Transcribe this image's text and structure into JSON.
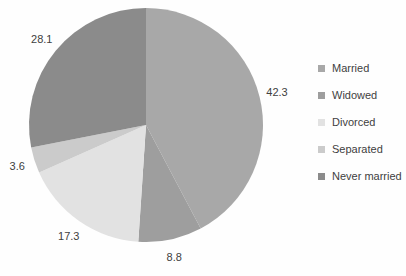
{
  "chart_data": {
    "type": "pie",
    "categories": [
      "Married",
      "Widowed",
      "Divorced",
      "Separated",
      "Never married"
    ],
    "values": [
      42.3,
      8.8,
      17.3,
      3.6,
      28.1
    ],
    "labels": [
      "42.3",
      "8.8",
      "17.3",
      "3.6",
      "28.1"
    ],
    "colors": [
      "#a8a8a8",
      "#9e9e9e",
      "#e2e2e2",
      "#cbcbcb",
      "#8b8b8b"
    ],
    "title": "",
    "legend_position": "right",
    "start_angle_deg": 0,
    "direction": "clockwise",
    "label_color": "#404040",
    "background": "#fefefe",
    "geometry": {
      "center_x": 146,
      "center_y": 125,
      "radius": 117,
      "label_radius": 135
    }
  }
}
